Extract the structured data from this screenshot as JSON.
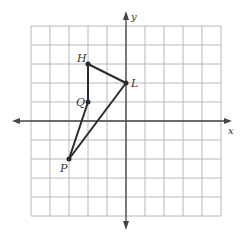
{
  "diagram": {
    "type": "coordinate-plane",
    "grid": {
      "xmin": -5,
      "xmax": 5,
      "ymin": -5,
      "ymax": 5,
      "step": 1
    },
    "origin_px": {
      "x": 126,
      "y": 121
    },
    "cell_px": 19,
    "axes": {
      "x_label": "x",
      "y_label": "y"
    },
    "points": [
      {
        "label": "H",
        "x": -2,
        "y": 3
      },
      {
        "label": "L",
        "x": 0,
        "y": 2
      },
      {
        "label": "Q",
        "x": -2,
        "y": 1
      },
      {
        "label": "P",
        "x": -3,
        "y": -2
      }
    ],
    "segments": [
      [
        "H",
        "L"
      ],
      [
        "H",
        "Q"
      ],
      [
        "Q",
        "P"
      ],
      [
        "P",
        "L"
      ]
    ],
    "colors": {
      "grid": "#b8b8b8",
      "axis": "#444444",
      "figure": "#2b2b2b",
      "label": "#333333"
    }
  }
}
